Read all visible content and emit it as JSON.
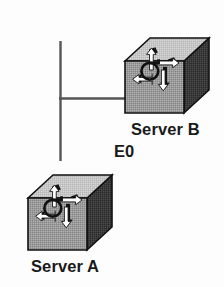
{
  "diagram": {
    "type": "network-topology",
    "background_color": "#fdfdfd",
    "nodes": [
      {
        "id": "server-b",
        "label": "Server B",
        "icon": "router-cube-icon",
        "position": "top-right",
        "front_face_color": "#989898",
        "top_face_color": "#c4c4c4",
        "side_face_color": "#3a3a3a",
        "outline_color": "#1a1a1a"
      },
      {
        "id": "server-a",
        "label": "Server A",
        "icon": "router-cube-icon",
        "position": "bottom-left",
        "front_face_color": "#989898",
        "top_face_color": "#c4c4c4",
        "side_face_color": "#3a3a3a",
        "outline_color": "#1a1a1a"
      }
    ],
    "interface_labels": [
      {
        "id": "e0",
        "label": "E0",
        "attached_to": "server-b"
      }
    ],
    "links": [
      {
        "id": "link-vertical",
        "orientation": "vertical",
        "color": "#555555",
        "from": "junction",
        "to": "server-a"
      },
      {
        "id": "link-horizontal",
        "orientation": "horizontal",
        "color": "#555555",
        "from": "junction",
        "to": "server-b"
      }
    ]
  }
}
